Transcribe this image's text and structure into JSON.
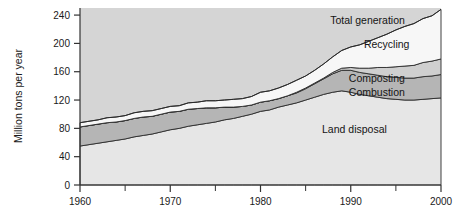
{
  "chart_data": {
    "type": "area",
    "title": "",
    "subtitle": "",
    "xlabel": "",
    "ylabel": "Million tons per year",
    "xlim": [
      1960,
      2000
    ],
    "ylim": [
      0,
      250
    ],
    "xticks": [
      1960,
      1970,
      1980,
      1990,
      2000
    ],
    "xtick_labels": [
      "1960",
      "1970",
      "1980",
      "1990",
      "2000"
    ],
    "xminorticks": [
      1965,
      1975,
      1985,
      1995
    ],
    "yticks": [
      0,
      40,
      80,
      120,
      160,
      200,
      240
    ],
    "ytick_labels": [
      "0",
      "40",
      "80",
      "120",
      "160",
      "200",
      "240"
    ],
    "grid": false,
    "stacked": true,
    "legend_position": "inline-right",
    "annotations": [
      {
        "text": "Total generation",
        "x": 1996.0,
        "y": 232
      },
      {
        "text": "Recycling",
        "x": 1996.5,
        "y": 198
      },
      {
        "text": "Composting",
        "x": 1996.0,
        "y": 150
      },
      {
        "text": "Combustion",
        "x": 1996.0,
        "y": 131
      },
      {
        "text": "Land disposal",
        "x": 1994.0,
        "y": 78
      }
    ],
    "x": [
      1960,
      1961,
      1962,
      1963,
      1964,
      1965,
      1966,
      1967,
      1968,
      1969,
      1970,
      1971,
      1972,
      1973,
      1974,
      1975,
      1976,
      1977,
      1978,
      1979,
      1980,
      1981,
      1982,
      1983,
      1984,
      1985,
      1986,
      1987,
      1988,
      1989,
      1990,
      1991,
      1992,
      1993,
      1994,
      1995,
      1996,
      1997,
      1998,
      1999,
      2000
    ],
    "series": [
      {
        "name": "Land disposal",
        "color": "#e6e6e6",
        "values": [
          55,
          57,
          59,
          61,
          63,
          65,
          68,
          70,
          72,
          75,
          78,
          80,
          83,
          85,
          87,
          89,
          92,
          94,
          97,
          100,
          104,
          106,
          110,
          113,
          116,
          120,
          124,
          128,
          131,
          133,
          131,
          128,
          126,
          124,
          122,
          121,
          120,
          120,
          121,
          122,
          123
        ]
      },
      {
        "name": "Combustion",
        "color": "#b5b5b5",
        "values": [
          27,
          27,
          27,
          27,
          26,
          26,
          26,
          26,
          25,
          25,
          25,
          24,
          24,
          23,
          22,
          20,
          18,
          16,
          14,
          13,
          13,
          13,
          12,
          13,
          14,
          16,
          19,
          22,
          26,
          29,
          31,
          31,
          31,
          31,
          31,
          31,
          31,
          31,
          32,
          32,
          33
        ]
      },
      {
        "name": "Composting",
        "color": "#cfcfcf",
        "values": [
          0,
          0,
          0,
          0,
          0,
          0,
          0,
          0,
          0,
          0,
          0,
          0,
          0,
          0,
          0,
          0,
          0,
          0,
          0,
          0,
          0,
          0,
          0,
          0,
          1,
          1,
          1,
          1,
          2,
          3,
          4,
          6,
          8,
          11,
          13,
          15,
          17,
          18,
          20,
          21,
          22
        ]
      },
      {
        "name": "Recycling",
        "color": "#f7f7f7",
        "values": [
          6,
          6,
          6,
          7,
          7,
          7,
          8,
          8,
          8,
          8,
          8,
          8,
          9,
          9,
          10,
          10,
          10,
          11,
          11,
          12,
          14,
          14,
          15,
          16,
          17,
          17,
          18,
          20,
          22,
          25,
          29,
          33,
          38,
          42,
          47,
          52,
          56,
          59,
          62,
          64,
          70
        ]
      }
    ],
    "total_generation": [
      88,
      90,
      92,
      95,
      96,
      98,
      102,
      104,
      105,
      108,
      111,
      112,
      116,
      117,
      119,
      119,
      120,
      121,
      122,
      125,
      131,
      133,
      137,
      142,
      148,
      154,
      162,
      171,
      181,
      190,
      195,
      198,
      203,
      208,
      213,
      219,
      224,
      228,
      235,
      239,
      248
    ],
    "plot_background": "#d5d5d5",
    "axis_color": "#333333"
  }
}
